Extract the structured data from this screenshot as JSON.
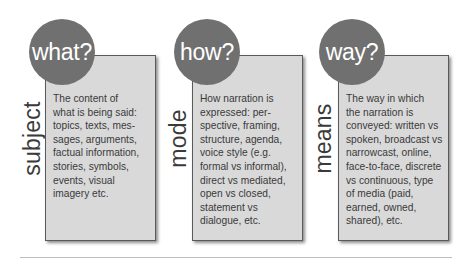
{
  "diagram": {
    "panels": [
      {
        "question": "what?",
        "label": "subject",
        "description": "The content of\nwhat is being said:\ntopics, texts, mes-\nsages, arguments,\nfactual information,\nstories, symbols,\nevents, visual\nimagery etc."
      },
      {
        "question": "how?",
        "label": "mode",
        "description": "How narration is\nexpressed: per-\nspective, framing,\nstructure, agenda,\nvoice style (e.g.\nformal vs informal),\ndirect vs mediated,\nopen vs closed,\nstatement vs\ndialogue, etc."
      },
      {
        "question": "way?",
        "label": "means",
        "description": "The way in which\nthe narration is\nconveyed: written vs\nspoken, broadcast vs\nnarrowcast, online,\nface-to-face, discrete\nvs continuous, type\nof media (paid,\nearned, owned,\nshared), etc."
      }
    ],
    "colors": {
      "circle_fill": "#707070",
      "circle_text": "#ffffff",
      "box_fill": "#d9d9d9",
      "box_border": "#5a5a5a",
      "text": "#3a3a3a"
    }
  }
}
